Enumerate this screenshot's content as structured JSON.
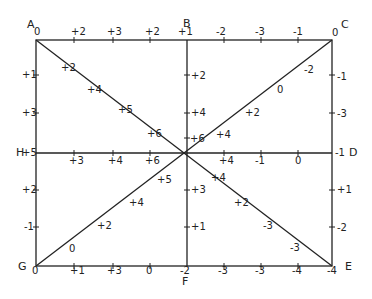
{
  "diagram": {
    "title": "",
    "corners": {
      "A": "A",
      "B": "B",
      "C": "C",
      "D": "D",
      "E": "E",
      "F": "F",
      "G": "G",
      "H": "H"
    },
    "top_edge": [
      "0",
      "+2",
      "+3",
      "+2",
      "+1",
      "-2",
      "-3",
      "-1",
      "0"
    ],
    "bottom_edge": [
      "0",
      "+1",
      "+3",
      "0",
      "-2",
      "-3",
      "-3",
      "-4",
      "-4"
    ],
    "left_edge": [
      "+1",
      "+3",
      "+5",
      "+2",
      "-1"
    ],
    "right_edge": [
      "-1",
      "-3",
      "-1",
      "+1",
      "-2"
    ],
    "vertical_center_BF": [
      "+2",
      "+4",
      "+6",
      "+3",
      "+1"
    ],
    "horizontal_center_HD": [
      "+3",
      "+4",
      "+6",
      "+4",
      "-1",
      "0"
    ],
    "diagonal_AE": [
      "+2",
      "+4",
      "+5",
      "+6",
      "+4",
      "+2",
      "-3",
      "-3"
    ],
    "diagonal_CG": [
      "-2",
      "0",
      "+2",
      "+4",
      "+5",
      "+4",
      "+2",
      "0"
    ]
  }
}
